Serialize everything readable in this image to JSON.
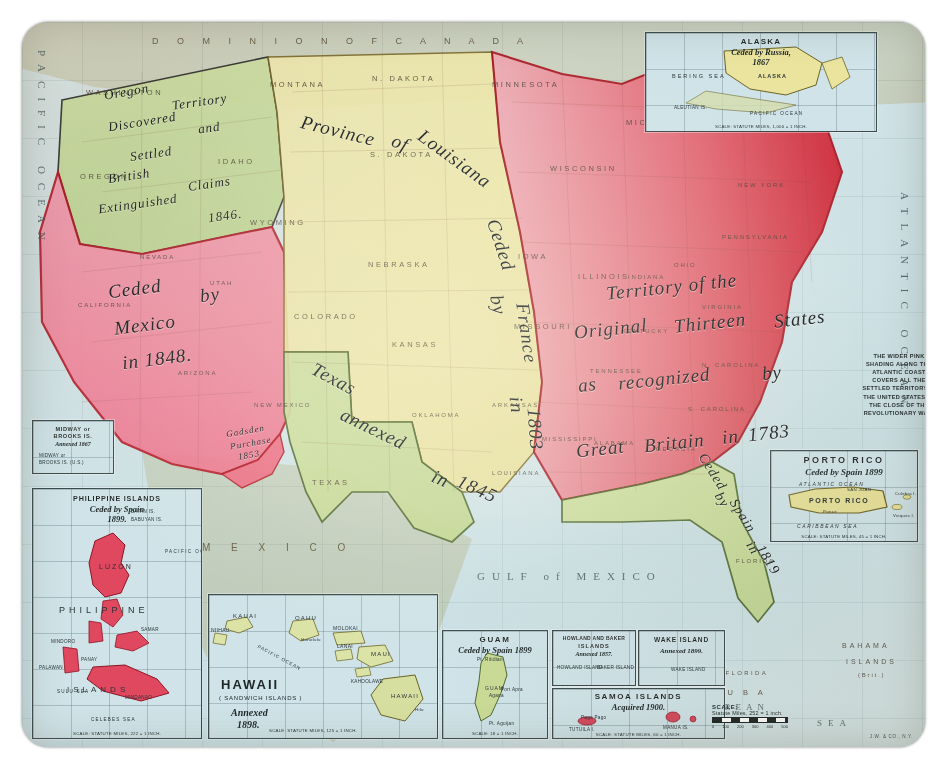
{
  "map": {
    "subject": "Territorial Growth of the United States",
    "sheet_color": "#e9f0f0",
    "accent_pink": "#e8516a",
    "accent_red": "#d4232f",
    "accent_green": "#c3d99a",
    "accent_yellow": "#efe8a8",
    "accent_rose": "#f2849c"
  },
  "acquisitions": [
    {
      "id": "oregon",
      "label_lines": [
        "Oregon",
        "Territory",
        "Discovered",
        "and",
        "Settled",
        "British",
        "Claims",
        "Extinguished",
        "1846."
      ],
      "label_flat": "Oregon Territory Discovered and Settled British Claims Extinguished 1846.",
      "color": "#c9dd9b"
    },
    {
      "id": "mexican-cession",
      "label_lines": [
        "Ceded",
        "by",
        "Mexico",
        "in 1848."
      ],
      "label_flat": "Ceded by Mexico in 1848.",
      "color": "#f2849c"
    },
    {
      "id": "louisiana-purchase",
      "label_lines": [
        "Province",
        "of",
        "Louisiana",
        "Ceded",
        "by",
        "France",
        "in",
        "1803"
      ],
      "label_flat": "Province of Louisiana Ceded by France in 1803",
      "color": "#efe8a8"
    },
    {
      "id": "texas-annexation",
      "label_lines": [
        "Texas",
        "annexed",
        "in",
        "1845"
      ],
      "label_flat": "Texas annexed in 1845",
      "color": "#c3d99a"
    },
    {
      "id": "original-thirteen",
      "label_lines": [
        "Territory of the",
        "Original",
        "Thirteen",
        "States",
        "as",
        "recognized",
        "by",
        "Great",
        "Britain",
        "in",
        "1783"
      ],
      "label_flat": "Territory of the Original Thirteen States as recognized by Great Britain in 1783",
      "color": "#e8516a"
    },
    {
      "id": "florida-cession",
      "label_lines": [
        "Ceded",
        "by",
        "Spain",
        "in",
        "1819"
      ],
      "label_flat": "Ceded by Spain in 1819",
      "color": "#c3d99a"
    },
    {
      "id": "gadsden-purchase",
      "label_lines": [
        "Gadsden",
        "Purchase",
        "1853"
      ],
      "label_flat": "Gadsden Purchase 1853",
      "color": "#e8516a"
    }
  ],
  "script_labels": {
    "oregon_l1": "Oregon",
    "oregon_l2": "Territory",
    "oregon_l3": "Discovered",
    "oregon_l4": "and",
    "oregon_l5": "Settled",
    "oregon_l6": "British",
    "oregon_l7": "Claims",
    "oregon_l8": "Extinguished",
    "oregon_l9": "1846.",
    "mexico_l1": "Ceded",
    "mexico_l2": "by",
    "mexico_l3": "Mexico",
    "mexico_l4": "in 1848.",
    "louisiana_l1": "Province",
    "louisiana_l2": "of",
    "louisiana_l3": "Louisiana",
    "louisiana_l4": "Ceded",
    "louisiana_l5": "by",
    "louisiana_l6": "France",
    "louisiana_l7": "in",
    "louisiana_l8": "1803",
    "texas_l1": "Texas",
    "texas_l2": "annexed",
    "texas_l3": "in",
    "texas_l4": "1845",
    "thirteen_l1": "Territory of the",
    "thirteen_l2": "Original",
    "thirteen_l3": "Thirteen",
    "thirteen_l4": "States",
    "thirteen_l5": "as",
    "thirteen_l6": "recognized",
    "thirteen_l7": "by",
    "thirteen_l8": "Great",
    "thirteen_l9": "Britain",
    "thirteen_l10": "in",
    "thirteen_l11": "1783",
    "florida_l1": "Ceded",
    "florida_l2": "by",
    "florida_l3": "Spain",
    "florida_l4": "in",
    "florida_l5": "1819",
    "gadsden_l1": "Gadsden",
    "gadsden_l2": "Purchase",
    "gadsden_l3": "1853"
  },
  "note": {
    "text": "THE WIDER PINK SHADING ALONG THE ATLANTIC COAST COVERS ALL THE SETTLED TERRITORY IN THE UNITED STATES AT THE CLOSE OF THE REVOLUTIONARY WAR."
  },
  "oceans": [
    {
      "id": "pacific",
      "label": "P A C I F I C   O C E A N"
    },
    {
      "id": "atlantic",
      "label": "A T L A N T I C   O C E A N"
    },
    {
      "id": "gulf",
      "label": "G U L F  of  M E X I C O"
    },
    {
      "id": "caribbean",
      "label": "C A R I B B E A N"
    },
    {
      "id": "caribbean2",
      "label": "S E A"
    }
  ],
  "ocean_labels": {
    "pacific": "PACIFIC OCEAN",
    "atlantic": "ATLANTIC OCEAN",
    "gulf": "GULF of MEXICO",
    "caribbean": "CARIBBEAN",
    "caribbean_sea": "SEA",
    "bahama": "BAHAMA",
    "islands": "ISLANDS",
    "islands_brit": "(Brit.)",
    "florida_straits": "STRAITS OF FLORIDA",
    "cuba": "C U B A"
  },
  "canada_label": "D O M I N I O N   O F   C A N A D A",
  "mexico_label": "M E X I C O",
  "states": [
    "WASHINGTON",
    "OREGON",
    "IDAHO",
    "MONTANA",
    "N. DAKOTA",
    "S. DAKOTA",
    "MINNESOTA",
    "WISCONSIN",
    "MICHIGAN",
    "WYOMING",
    "NEBRASKA",
    "IOWA",
    "ILLINOIS",
    "INDIANA",
    "OHIO",
    "PENNSYLVANIA",
    "NEW YORK",
    "CALIFORNIA",
    "NEVADA",
    "UTAH",
    "COLORADO",
    "KANSAS",
    "MISSOURI",
    "KENTUCKY",
    "VIRGINIA",
    "ARIZONA",
    "NEW MEXICO",
    "OKLAHOMA",
    "ARKANSAS",
    "TENNESSEE",
    "N. CAROLINA",
    "S. CAROLINA",
    "GEORGIA",
    "ALABAMA",
    "MISSISSIPPI",
    "LOUISIANA",
    "TEXAS",
    "FLORIDA",
    "MAINE"
  ],
  "insets": [
    {
      "id": "alaska",
      "title": "ALASKA",
      "subtitle": "Ceded by Russia,",
      "year": "1867",
      "features": [
        "ALASKA",
        "BERING SEA",
        "ALEUTIAN IS.",
        "PACIFIC OCEAN"
      ],
      "scale": "SCALE: STATUTE MILES, 1,000 = 1 INCH."
    },
    {
      "id": "midway",
      "title": "MIDWAY or",
      "title2": "BROOKS IS.",
      "subtitle": "Annexed 1867",
      "features": [
        "MIDWAY or",
        "BROOKS IS. (U.S.)"
      ],
      "scale": ""
    },
    {
      "id": "philippines",
      "title": "PHILIPPINE ISLANDS",
      "subtitle": "Ceded by Spain",
      "year": "1899.",
      "features": [
        "LUZON",
        "PHILIPPINE",
        "ISLANDS",
        "MINDORO",
        "PANAY",
        "SAMAR",
        "PALAWAN",
        "MINDANAO",
        "SULU SEA",
        "CELEBES SEA",
        "PACIFIC OCEAN",
        "BABUYAN IS.",
        "BATAN IS."
      ],
      "scale": "SCALE: STATUTE MILES, 222 = 1 INCH."
    },
    {
      "id": "hawaii",
      "title": "HAWAII",
      "subtitle": "( SANDWICH ISLANDS )",
      "annex": "Annexed",
      "year": "1898.",
      "features": [
        "KAUAI",
        "NIIHAU",
        "OAHU",
        "MOLOKAI",
        "LANAI",
        "MAUI",
        "KAHOOLAWE",
        "HAWAII",
        "Honolulu",
        "Hilo",
        "PACIFIC OCEAN"
      ],
      "scale": "SCALE: STATUTE MILES, 125 = 1 INCH."
    },
    {
      "id": "guam",
      "title": "GUAM",
      "subtitle": "Ceded by Spain 1899",
      "features": [
        "GUAM",
        "Pt. Ritidian",
        "Agana",
        "Port Apra",
        "Pt. Aguijan"
      ],
      "scale": "SCALE: 18 = 1 INCH."
    },
    {
      "id": "howland-baker",
      "title": "HOWLAND AND BAKER",
      "title2": "ISLANDS",
      "subtitle": "Annexed 1857.",
      "features": [
        "HOWLAND ISLAND",
        "BAKER ISLAND"
      ],
      "scale": ""
    },
    {
      "id": "wake",
      "title": "WAKE ISLAND",
      "subtitle": "Annexed 1899.",
      "features": [
        "WAKE ISLAND"
      ],
      "scale": ""
    },
    {
      "id": "samoa",
      "title": "SAMOA ISLANDS",
      "subtitle": "Acquired 1900.",
      "features": [
        "TUTUILA I.",
        "MANUA IS.",
        "Pago Pago"
      ],
      "scale": "SCALE: STATUTE MILES, 60 = 1 INCH."
    },
    {
      "id": "porto-rico",
      "title": "PORTO RICO",
      "subtitle": "Ceded by Spain 1899",
      "features": [
        "PORTO RICO",
        "ATLANTIC OCEAN",
        "CARIBBEAN SEA",
        "SAN JUAN",
        "Ponce",
        "Vieques I.",
        "Culebra I."
      ],
      "scale": "SCALE: STATUTE MILES, 45 = 1 INCH."
    }
  ],
  "scale": {
    "title": "SCALE:",
    "detail": "Statute Miles, 252 = 1 inch.",
    "ticks": [
      "0",
      "100",
      "200",
      "300",
      "400",
      "500"
    ]
  },
  "imprint": "J.W. & CO., N.Y."
}
